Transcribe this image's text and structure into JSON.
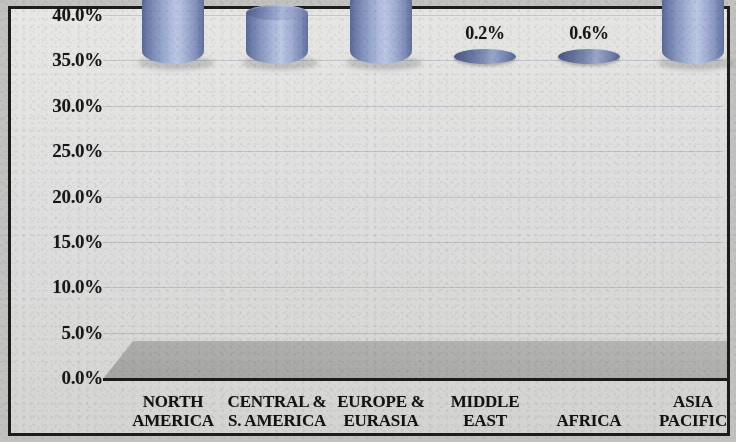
{
  "chart_data": {
    "type": "bar",
    "title": "",
    "subtitle": "",
    "xlabel": "",
    "ylabel": "",
    "categories": [
      "NORTH AMERICA",
      "CENTRAL & S. AMERICA",
      "EUROPE & EURASIA",
      "MIDDLE EAST",
      "AFRICA",
      "ASIA PACIFIC"
    ],
    "category_lines": [
      [
        "NORTH",
        "AMERICA"
      ],
      [
        "CENTRAL &",
        "S. AMERICA"
      ],
      [
        "EUROPE &",
        "EURASIA"
      ],
      [
        "MIDDLE",
        "EAST"
      ],
      [
        "AFRICA",
        ""
      ],
      [
        "ASIA",
        "PACIFIC"
      ]
    ],
    "values": [
      23.4,
      6.5,
      41.3,
      0.2,
      0.6,
      28.0
    ],
    "data_labels": [
      "23.4%",
      "6.5%",
      "41.3%",
      "0.2%",
      "0.6%",
      "28.0%"
    ],
    "ylim": [
      0,
      40
    ],
    "ytick_step": 5,
    "ytick_labels": [
      "40.0%",
      "35.0%",
      "30.0%",
      "25.0%",
      "20.0%",
      "15.0%",
      "10.0%",
      "5.0%",
      "0.0%"
    ],
    "ytick_values": [
      40,
      35,
      30,
      25,
      20,
      15,
      10,
      5,
      0
    ],
    "grid": true,
    "legend": false,
    "legend_position": "none",
    "bar_style": "3d-cylinder",
    "colors": {
      "bar_light": "#bcc7e4",
      "bar_mid": "#8d9cc4",
      "bar_dark": "#5b6a94",
      "plot_background": "#e0e0de",
      "floor": "#acacaa",
      "axis_line": "#1b1b1b",
      "text": "#171717",
      "gridline": "#787e8c"
    }
  }
}
